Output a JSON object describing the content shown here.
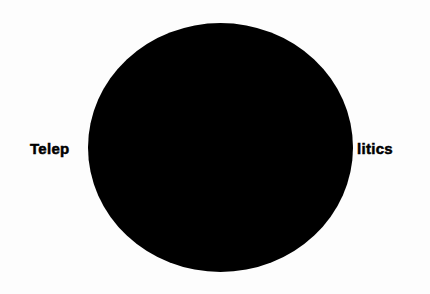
{
  "text": {
    "left_fragment": "Telep",
    "right_fragment": "litics"
  },
  "shape": {
    "type": "ellipse",
    "fill": "#000000",
    "center": [
      220,
      147
    ],
    "radius_x": 132,
    "radius_y": 124
  },
  "colors": {
    "background": "#fdfdfd",
    "text": "#000000",
    "disc": "#000000"
  }
}
